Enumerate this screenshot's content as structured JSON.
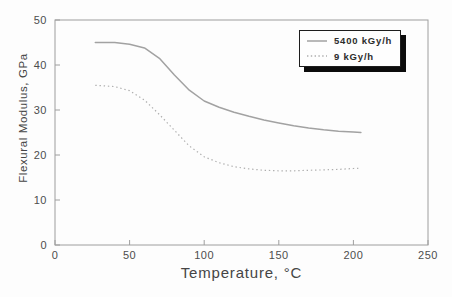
{
  "figure": {
    "background": "#fdfdfd",
    "frame_color": "#9e9e9e",
    "tick_color": "#9e9e9e",
    "text_color": "#4d4d4d"
  },
  "chart_data": {
    "type": "line",
    "title": "",
    "xlabel": "Temperature, °C",
    "ylabel": "Flexural Modulus, GPa",
    "xlim": [
      0,
      250
    ],
    "ylim": [
      0,
      50
    ],
    "xticks": [
      0,
      50,
      100,
      150,
      200,
      250
    ],
    "yticks": [
      0,
      10,
      20,
      30,
      40,
      50
    ],
    "grid": false,
    "legend_position": "top-right",
    "x": [
      27,
      40,
      50,
      60,
      70,
      80,
      90,
      100,
      110,
      120,
      130,
      140,
      150,
      160,
      170,
      180,
      190,
      200,
      205
    ],
    "series": [
      {
        "name": "5400 kGy/h",
        "style": "solid",
        "color": "#a2a2a2",
        "values": [
          45,
          45,
          44.6,
          43.8,
          41.5,
          37.8,
          34.4,
          32,
          30.6,
          29.5,
          28.6,
          27.8,
          27.1,
          26.5,
          26,
          25.6,
          25.3,
          25.1,
          25
        ]
      },
      {
        "name": "9 kGy/h",
        "style": "dotted",
        "color": "#aeaeae",
        "values": [
          35.5,
          35.2,
          34.3,
          32.2,
          29,
          25.5,
          22,
          19.6,
          18.3,
          17.4,
          16.9,
          16.6,
          16.5,
          16.5,
          16.6,
          16.7,
          16.8,
          17,
          17.1
        ]
      }
    ]
  }
}
